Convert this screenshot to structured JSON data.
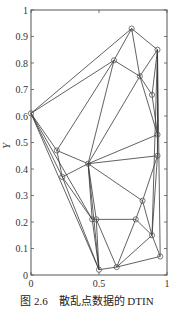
{
  "chart_data": {
    "type": "scatter",
    "subtype": "triangulated-irregular-network",
    "title": "",
    "xlabel": "X",
    "ylabel": "Y",
    "xlim": [
      0,
      1
    ],
    "ylim": [
      0,
      1
    ],
    "grid": false,
    "x_ticks": [
      "0",
      "0.5",
      "1"
    ],
    "x_tick_values": [
      0,
      0.5,
      1
    ],
    "y_ticks": [
      "0",
      "0.1",
      "0.2",
      "0.3",
      "0.4",
      "0.5",
      "0.6",
      "0.7",
      "0.8",
      "0.9",
      "1"
    ],
    "y_tick_values": [
      0,
      0.1,
      0.2,
      0.3,
      0.4,
      0.5,
      0.6,
      0.7,
      0.8,
      0.9,
      1
    ],
    "points": [
      {
        "x": 0.0,
        "y": 0.61
      },
      {
        "x": 0.74,
        "y": 0.93
      },
      {
        "x": 0.93,
        "y": 0.85
      },
      {
        "x": 0.61,
        "y": 0.81
      },
      {
        "x": 0.8,
        "y": 0.75
      },
      {
        "x": 0.89,
        "y": 0.68
      },
      {
        "x": 0.93,
        "y": 0.53
      },
      {
        "x": 0.19,
        "y": 0.47
      },
      {
        "x": 0.42,
        "y": 0.42
      },
      {
        "x": 0.93,
        "y": 0.45
      },
      {
        "x": 0.23,
        "y": 0.37
      },
      {
        "x": 0.82,
        "y": 0.28
      },
      {
        "x": 0.45,
        "y": 0.21
      },
      {
        "x": 0.48,
        "y": 0.21
      },
      {
        "x": 0.77,
        "y": 0.21
      },
      {
        "x": 0.89,
        "y": 0.15
      },
      {
        "x": 0.95,
        "y": 0.07
      },
      {
        "x": 0.5,
        "y": 0.02
      },
      {
        "x": 0.63,
        "y": 0.03
      }
    ],
    "edges": [
      [
        0,
        1
      ],
      [
        0,
        3
      ],
      [
        0,
        7
      ],
      [
        0,
        10
      ],
      [
        0,
        12
      ],
      [
        0,
        17
      ],
      [
        1,
        2
      ],
      [
        1,
        3
      ],
      [
        1,
        4
      ],
      [
        2,
        4
      ],
      [
        2,
        5
      ],
      [
        2,
        6
      ],
      [
        2,
        9
      ],
      [
        2,
        15
      ],
      [
        2,
        16
      ],
      [
        3,
        4
      ],
      [
        3,
        8
      ],
      [
        3,
        7
      ],
      [
        4,
        5
      ],
      [
        4,
        8
      ],
      [
        4,
        6
      ],
      [
        5,
        6
      ],
      [
        6,
        8
      ],
      [
        6,
        9
      ],
      [
        7,
        8
      ],
      [
        7,
        10
      ],
      [
        8,
        9
      ],
      [
        8,
        10
      ],
      [
        8,
        12
      ],
      [
        8,
        13
      ],
      [
        8,
        11
      ],
      [
        8,
        17
      ],
      [
        9,
        11
      ],
      [
        9,
        15
      ],
      [
        10,
        12
      ],
      [
        10,
        17
      ],
      [
        11,
        14
      ],
      [
        11,
        15
      ],
      [
        12,
        13
      ],
      [
        12,
        17
      ],
      [
        13,
        14
      ],
      [
        13,
        17
      ],
      [
        13,
        18
      ],
      [
        14,
        15
      ],
      [
        14,
        18
      ],
      [
        15,
        16
      ],
      [
        15,
        18
      ],
      [
        16,
        18
      ],
      [
        17,
        18
      ]
    ],
    "marker": "circle-open",
    "line_color": "#3a3a3a",
    "marker_color": "#555555"
  },
  "caption": {
    "figure_number": "图 2.6",
    "text": "散乱点数据的 DTIN"
  }
}
